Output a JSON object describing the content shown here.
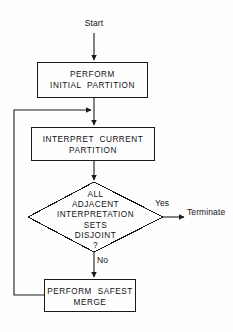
{
  "diagram": {
    "type": "flowchart",
    "background_color": "#fefefe",
    "line_color": "#1a1a1a",
    "text_color": "#111111",
    "canvas": {
      "width": 233,
      "height": 332
    }
  },
  "labels": {
    "start": "Start",
    "yes": "Yes",
    "no": "No",
    "terminate": "Terminate"
  },
  "nodes": {
    "box1": {
      "shape": "rectangle",
      "line1": "PERFORM",
      "line2": "INITIAL  PARTITION",
      "text": "PERFORM\nINITIAL  PARTITION"
    },
    "box2": {
      "shape": "rectangle",
      "line1": "INTERPRET  CURRENT",
      "line2": "PARTITION",
      "text": "INTERPRET  CURRENT\nPARTITION"
    },
    "decision": {
      "shape": "diamond",
      "line1": "ALL",
      "line2": "ADJACENT",
      "line3": "INTERPRETATION",
      "line4": "SETS",
      "line5": "DISJOINT",
      "line6": "?",
      "text": "ALL\nADJACENT\nINTERPRETATION\nSETS\nDISJOINT\n?"
    },
    "box3": {
      "shape": "rectangle",
      "line1": "PERFORM  SAFEST",
      "line2": "MERGE",
      "text": "PERFORM  SAFEST\nMERGE"
    }
  },
  "edges": [
    {
      "from": "start",
      "to": "box1",
      "label": ""
    },
    {
      "from": "box1",
      "to": "box2",
      "label": ""
    },
    {
      "from": "box2",
      "to": "decision",
      "label": ""
    },
    {
      "from": "decision",
      "to": "terminate",
      "label": "Yes"
    },
    {
      "from": "decision",
      "to": "box3",
      "label": "No"
    },
    {
      "from": "box3",
      "to": "box2",
      "label": ""
    }
  ]
}
